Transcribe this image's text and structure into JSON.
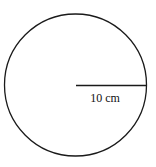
{
  "diagram": {
    "shape": "circle",
    "radius_label": "10 cm",
    "stroke_color": "#1a1a1a",
    "background_color": "#ffffff"
  }
}
